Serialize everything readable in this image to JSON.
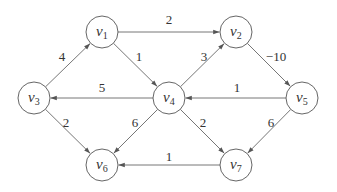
{
  "graph": {
    "type": "weighted directed graph",
    "nodes": [
      {
        "id": "v1",
        "base": "v",
        "sub": "1",
        "x": 102,
        "y": 32
      },
      {
        "id": "v2",
        "base": "v",
        "sub": "2",
        "x": 236,
        "y": 32
      },
      {
        "id": "v3",
        "base": "v",
        "sub": "3",
        "x": 34,
        "y": 98
      },
      {
        "id": "v4",
        "base": "v",
        "sub": "4",
        "x": 169,
        "y": 98
      },
      {
        "id": "v5",
        "base": "v",
        "sub": "5",
        "x": 302,
        "y": 98
      },
      {
        "id": "v6",
        "base": "v",
        "sub": "6",
        "x": 102,
        "y": 165
      },
      {
        "id": "v7",
        "base": "v",
        "sub": "7",
        "x": 236,
        "y": 165
      }
    ],
    "edges": [
      {
        "from": "v1",
        "to": "v2",
        "weight": "2",
        "lx": 169,
        "ly": 24
      },
      {
        "from": "v1",
        "to": "v4",
        "weight": "1",
        "lx": 139,
        "ly": 61
      },
      {
        "from": "v3",
        "to": "v1",
        "weight": "4",
        "lx": 62,
        "ly": 61
      },
      {
        "from": "v4",
        "to": "v2",
        "weight": "3",
        "lx": 204,
        "ly": 61
      },
      {
        "from": "v2",
        "to": "v5",
        "weight": "-10",
        "lx": 276,
        "ly": 61
      },
      {
        "from": "v4",
        "to": "v3",
        "weight": "5",
        "lx": 102,
        "ly": 92
      },
      {
        "from": "v5",
        "to": "v4",
        "weight": "1",
        "lx": 237,
        "ly": 92
      },
      {
        "from": "v3",
        "to": "v6",
        "weight": "2",
        "lx": 66,
        "ly": 127
      },
      {
        "from": "v4",
        "to": "v6",
        "weight": "6",
        "lx": 135,
        "ly": 127
      },
      {
        "from": "v4",
        "to": "v7",
        "weight": "2",
        "lx": 203,
        "ly": 127
      },
      {
        "from": "v5",
        "to": "v7",
        "weight": "6",
        "lx": 271,
        "ly": 127
      },
      {
        "from": "v7",
        "to": "v6",
        "weight": "1",
        "lx": 169,
        "ly": 161
      }
    ]
  }
}
